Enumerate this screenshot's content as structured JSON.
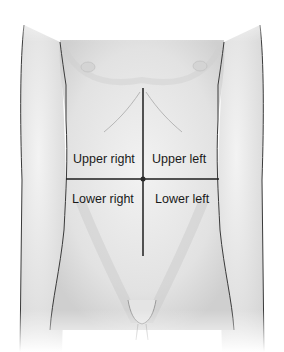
{
  "diagram": {
    "quadrants": {
      "upper_right": "Upper right",
      "upper_left": "Upper left",
      "lower_right": "Lower right",
      "lower_left": "Lower left"
    },
    "colors": {
      "skin_light": "#f4f4f4",
      "skin_shade": "#d6d6d6",
      "outline": "#3a3a3a",
      "divider_line": "#1e1e1e",
      "label_text": "#1a1a1a"
    }
  }
}
